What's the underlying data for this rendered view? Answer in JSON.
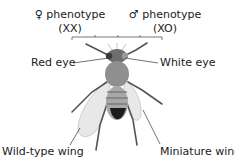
{
  "header": {
    "female": {
      "symbol": "♀",
      "label": "phenotype",
      "genotype": "(XX)"
    },
    "male": {
      "symbol": "♂",
      "label": "phenotype",
      "genotype": "(XO)"
    }
  },
  "labels": {
    "left_eye": "Red eye",
    "right_eye": "White eye",
    "left_wing": "Wild-type wing",
    "right_wing": "Miniature wing"
  },
  "colors": {
    "text": "#1a1a1a",
    "line": "#333333",
    "body": "#8a8a8a",
    "wing": "#e6e6e6"
  }
}
